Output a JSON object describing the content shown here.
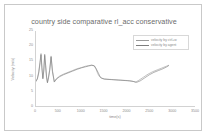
{
  "chart_data": {
    "type": "line",
    "title": "country side comparative rl_acc conservative",
    "xlabel": "time(s)",
    "ylabel": "Velocity (m/s)",
    "xlim": [
      0,
      3500
    ],
    "ylim": [
      0,
      25
    ],
    "grid": false,
    "legend_position": "top-right",
    "xticks": [
      0,
      500,
      1000,
      1500,
      2000,
      2500,
      3000,
      3500
    ],
    "yticks": [
      0,
      5,
      10,
      15,
      20,
      25
    ],
    "series": [
      {
        "name": "velocity by ctrl+w",
        "color": "#9a9a9a",
        "x": [
          0,
          30,
          60,
          90,
          110,
          130,
          150,
          170,
          190,
          210,
          230,
          250,
          270,
          300,
          330,
          360,
          400,
          450,
          520,
          600,
          700,
          800,
          900,
          1000,
          1080,
          1150,
          1220,
          1270,
          1310,
          1340,
          1370,
          1400,
          1440,
          1500,
          1600,
          1700,
          1800,
          1900,
          2000,
          2100,
          2180,
          2250,
          2350,
          2450,
          2550,
          2650,
          2750,
          2850,
          2900
        ],
        "y": [
          8.6,
          9.4,
          11.6,
          15.2,
          17.6,
          13.0,
          9.6,
          12.2,
          17.4,
          14.0,
          10.2,
          8.2,
          9.6,
          12.4,
          16.8,
          12.0,
          8.4,
          9.4,
          10.2,
          10.8,
          11.4,
          12.0,
          12.6,
          13.0,
          13.4,
          13.6,
          13.8,
          13.6,
          12.6,
          11.4,
          10.4,
          9.8,
          9.4,
          9.2,
          9.1,
          9.0,
          8.9,
          8.8,
          8.7,
          8.5,
          8.2,
          8.8,
          9.8,
          10.8,
          11.6,
          12.2,
          12.8,
          13.4,
          13.7
        ]
      },
      {
        "name": "velocity by agent",
        "color": "#7d7d7d",
        "x": [
          0,
          30,
          60,
          90,
          110,
          130,
          150,
          170,
          190,
          210,
          230,
          250,
          270,
          300,
          330,
          360,
          400,
          450,
          520,
          600,
          700,
          800,
          900,
          1000,
          1080,
          1150,
          1220,
          1280,
          1330,
          1370,
          1400,
          1440,
          1490,
          1550,
          1650,
          1750,
          1850,
          1950,
          2050,
          2130,
          2200,
          2280,
          2380,
          2480,
          2580,
          2680,
          2780,
          2860,
          2900
        ],
        "y": [
          8.4,
          9.2,
          11.2,
          14.6,
          17.2,
          12.6,
          9.2,
          11.8,
          17.0,
          13.6,
          9.8,
          7.9,
          9.2,
          12.0,
          16.4,
          11.6,
          8.2,
          9.2,
          10.0,
          10.6,
          11.2,
          11.8,
          12.4,
          12.9,
          13.2,
          13.5,
          13.7,
          13.5,
          12.2,
          11.0,
          10.0,
          9.5,
          9.2,
          9.1,
          9.0,
          8.9,
          8.8,
          8.7,
          8.6,
          8.4,
          8.1,
          8.6,
          9.6,
          10.6,
          11.4,
          12.0,
          12.6,
          13.2,
          13.6
        ]
      }
    ]
  }
}
